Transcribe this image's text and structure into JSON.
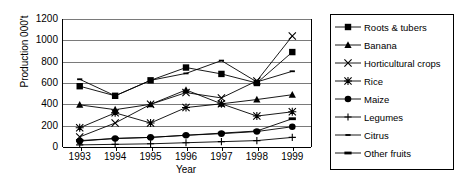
{
  "chart_data": {
    "type": "line",
    "title": "",
    "xlabel": "Year",
    "ylabel": "Production 000't",
    "categories": [
      "1993",
      "1994",
      "1995",
      "1996",
      "1997",
      "1998",
      "1999"
    ],
    "x": [
      1993,
      1994,
      1995,
      1996,
      1997,
      1998,
      1999
    ],
    "ylim": [
      0,
      1200
    ],
    "yticks": [
      0,
      200,
      400,
      600,
      800,
      1000,
      1200
    ],
    "grid": true,
    "legend_position": "right",
    "series": [
      {
        "name": "Roots & tubers",
        "marker": "filled-square",
        "values": [
          570,
          480,
          625,
          745,
          685,
          600,
          890
        ]
      },
      {
        "name": "Banana",
        "marker": "filled-triangle",
        "values": [
          395,
          350,
          400,
          535,
          405,
          445,
          490
        ]
      },
      {
        "name": "Horticultural crops",
        "marker": "cross-x",
        "values": [
          95,
          225,
          400,
          510,
          460,
          620,
          1040
        ]
      },
      {
        "name": "Rice",
        "marker": "asterisk",
        "values": [
          180,
          320,
          225,
          370,
          405,
          290,
          330
        ]
      },
      {
        "name": "Maize",
        "marker": "filled-circle",
        "values": [
          55,
          80,
          90,
          110,
          125,
          145,
          190
        ]
      },
      {
        "name": "Legumes",
        "marker": "plus",
        "values": [
          20,
          25,
          30,
          40,
          50,
          60,
          90
        ]
      },
      {
        "name": "Citrus",
        "marker": "small-dash",
        "values": [
          635,
          480,
          625,
          690,
          810,
          610,
          710
        ]
      },
      {
        "name": "Other fruits",
        "marker": "thick-dash",
        "values": [
          60,
          80,
          90,
          110,
          130,
          150,
          265
        ]
      }
    ]
  },
  "legend": {
    "items": [
      {
        "label": "Roots & tubers",
        "icon": "filled-square-marker-icon"
      },
      {
        "label": "Banana",
        "icon": "filled-triangle-marker-icon"
      },
      {
        "label": "Horticultural crops",
        "icon": "cross-x-marker-icon"
      },
      {
        "label": "Rice",
        "icon": "asterisk-marker-icon"
      },
      {
        "label": "Maize",
        "icon": "filled-circle-marker-icon"
      },
      {
        "label": "Legumes",
        "icon": "plus-marker-icon"
      },
      {
        "label": "Citrus",
        "icon": "small-dash-marker-icon"
      },
      {
        "label": "Other fruits",
        "icon": "thick-dash-marker-icon"
      }
    ]
  },
  "colors": {
    "series_line": "#000000",
    "gridline": "#7a7a7a",
    "axis": "#000000",
    "background": "#ffffff"
  }
}
